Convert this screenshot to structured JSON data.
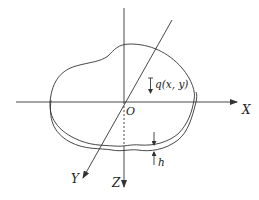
{
  "diagram": {
    "type": "thin plate under transverse load with coordinate axes",
    "labels": {
      "x_axis": "X",
      "y_axis": "Y",
      "z_axis": "Z",
      "origin": "O",
      "load": "q(x, y)",
      "thickness": "h"
    },
    "colors": {
      "line": "#333333",
      "text": "#222222",
      "background": "#ffffff"
    }
  }
}
